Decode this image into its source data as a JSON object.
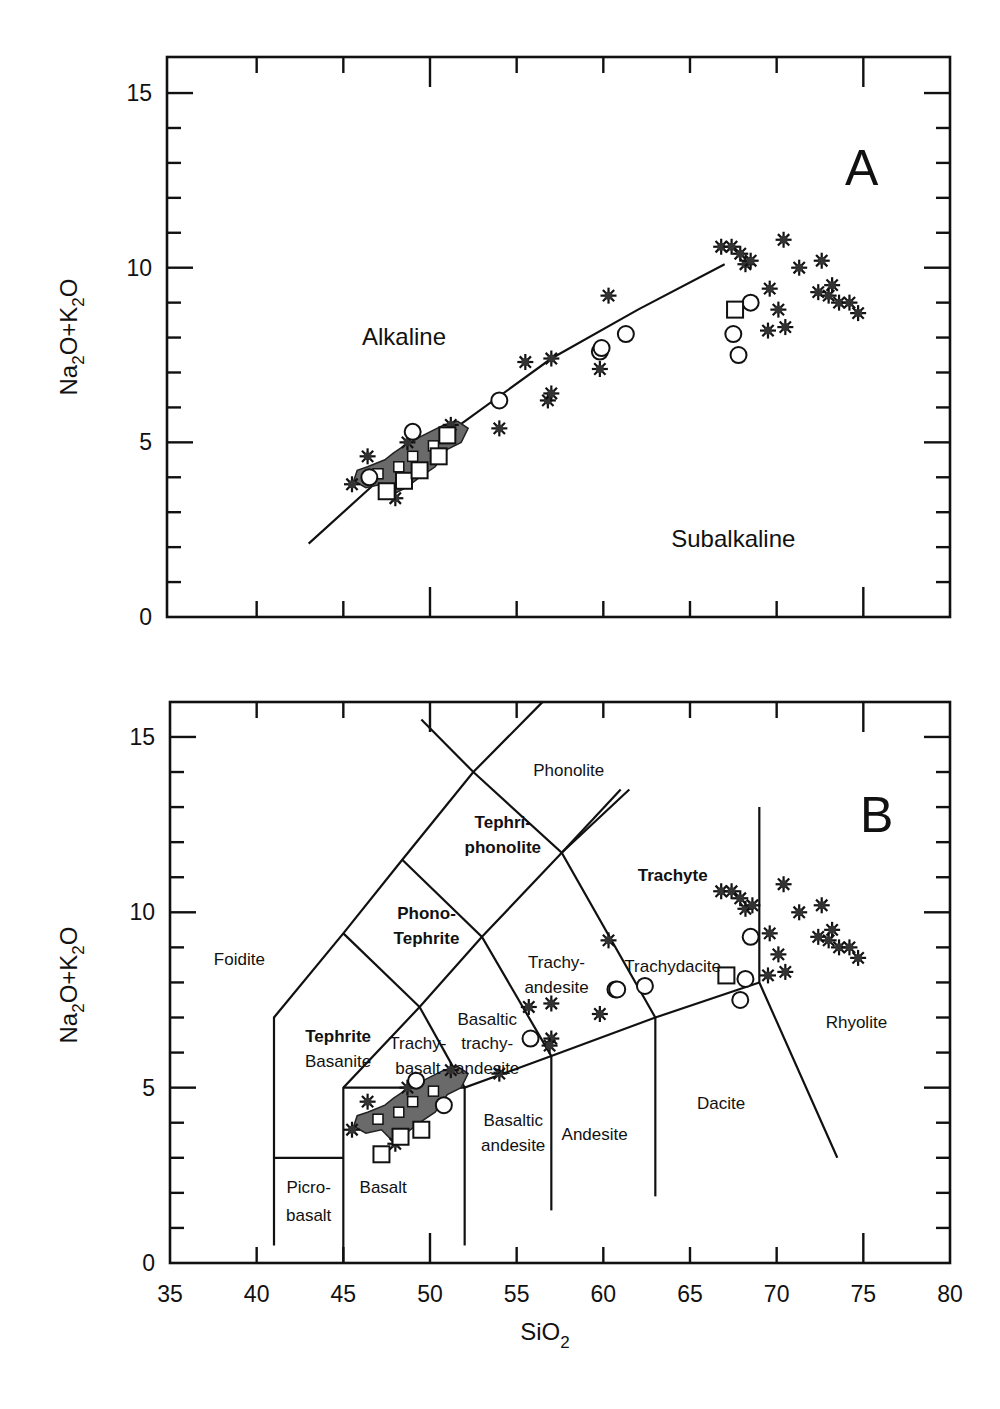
{
  "figure": {
    "x_axis_label": "SiO",
    "x_axis_label_sub": "2",
    "y_axis_label_parts": [
      "Na",
      "2",
      "O+K",
      "2",
      "O"
    ]
  },
  "chart_data": [
    {
      "type": "scatter",
      "panel_label": "A",
      "title": "Alkaline vs Subalkaline (TAS)",
      "xlabel": "SiO2",
      "ylabel": "Na2O+K2O",
      "xlim": [
        35,
        80
      ],
      "ylim": [
        0,
        16
      ],
      "y_ticks": [
        0,
        5,
        10,
        15
      ],
      "x_tick_labels_shown": false,
      "grid": false,
      "region_labels": [
        {
          "text": "Alkaline",
          "x": 48.5,
          "y": 7.8
        },
        {
          "text": "Subalkaline",
          "x": 67.5,
          "y": 2.0
        }
      ],
      "divider_line": {
        "name": "Alkaline-Subalkaline boundary",
        "points": [
          [
            43.0,
            2.1
          ],
          [
            47.0,
            3.9
          ],
          [
            52.0,
            5.6
          ],
          [
            57.0,
            7.4
          ],
          [
            62.0,
            8.8
          ],
          [
            67.0,
            10.1
          ]
        ]
      },
      "series": [
        {
          "name": "asterisks",
          "marker": "asterisk",
          "points": [
            [
              45.5,
              3.8
            ],
            [
              46.4,
              4.6
            ],
            [
              48.0,
              3.4
            ],
            [
              48.7,
              5.0
            ],
            [
              51.2,
              5.5
            ],
            [
              54.0,
              5.4
            ],
            [
              55.5,
              7.3
            ],
            [
              57.0,
              7.4
            ],
            [
              56.8,
              6.2
            ],
            [
              57.0,
              6.4
            ],
            [
              59.8,
              7.1
            ],
            [
              60.3,
              9.2
            ],
            [
              66.8,
              10.6
            ],
            [
              67.4,
              10.6
            ],
            [
              67.9,
              10.4
            ],
            [
              68.2,
              10.1
            ],
            [
              68.5,
              10.2
            ],
            [
              69.6,
              9.4
            ],
            [
              70.1,
              8.8
            ],
            [
              69.5,
              8.2
            ],
            [
              70.5,
              8.3
            ],
            [
              70.4,
              10.8
            ],
            [
              71.3,
              10.0
            ],
            [
              72.6,
              10.2
            ],
            [
              72.4,
              9.3
            ],
            [
              73.0,
              9.2
            ],
            [
              73.6,
              9.0
            ],
            [
              74.2,
              9.0
            ],
            [
              74.7,
              8.7
            ],
            [
              73.2,
              9.5
            ]
          ]
        },
        {
          "name": "circles",
          "marker": "open-circle",
          "points": [
            [
              46.5,
              4.0
            ],
            [
              49.0,
              5.3
            ],
            [
              54.0,
              6.2
            ],
            [
              59.8,
              7.6
            ],
            [
              59.9,
              7.7
            ],
            [
              61.3,
              8.1
            ],
            [
              67.5,
              8.1
            ],
            [
              67.8,
              7.5
            ],
            [
              68.5,
              9.0
            ]
          ]
        },
        {
          "name": "squares",
          "marker": "open-square",
          "points": [
            [
              47.5,
              3.6
            ],
            [
              48.5,
              3.9
            ],
            [
              49.4,
              4.2
            ],
            [
              50.5,
              4.6
            ],
            [
              51.0,
              5.2
            ],
            [
              67.6,
              8.8
            ]
          ]
        },
        {
          "name": "shaded-field",
          "marker": "filled-gray-area",
          "description": "dense cluster of basaltic samples",
          "extent": {
            "x": [
              45.5,
              52.5
            ],
            "y": [
              3.5,
              5.5
            ]
          }
        }
      ]
    },
    {
      "type": "scatter",
      "panel_label": "B",
      "title": "Total Alkali-Silica classification",
      "xlabel": "SiO2",
      "ylabel": "Na2O+K2O",
      "xlim": [
        35,
        80
      ],
      "ylim": [
        0,
        16
      ],
      "x_ticks": [
        35,
        40,
        45,
        50,
        55,
        60,
        65,
        70,
        75,
        80
      ],
      "y_ticks": [
        0,
        5,
        10,
        15
      ],
      "grid": false,
      "field_labels": [
        {
          "text": "Phonolite",
          "x": 58.0,
          "y": 13.9,
          "bold": false
        },
        {
          "text": "Tephri-",
          "x": 54.2,
          "y": 12.4,
          "bold": true
        },
        {
          "text": "phonolite",
          "x": 54.2,
          "y": 11.7,
          "bold": true
        },
        {
          "text": "Phono-",
          "x": 49.8,
          "y": 9.8,
          "bold": true
        },
        {
          "text": "Tephrite",
          "x": 49.8,
          "y": 9.1,
          "bold": true
        },
        {
          "text": "Foidite",
          "x": 39.0,
          "y": 8.5,
          "bold": false
        },
        {
          "text": "Tephrite",
          "x": 44.7,
          "y": 6.3,
          "bold": true
        },
        {
          "text": "Basanite",
          "x": 44.7,
          "y": 5.6,
          "bold": false
        },
        {
          "text": "Trachy-",
          "x": 49.3,
          "y": 6.1,
          "bold": false
        },
        {
          "text": "basalt",
          "x": 49.3,
          "y": 5.4,
          "bold": false
        },
        {
          "text": "Basaltic",
          "x": 53.3,
          "y": 6.8,
          "bold": false
        },
        {
          "text": "trachy-",
          "x": 53.3,
          "y": 6.1,
          "bold": false
        },
        {
          "text": "andesite",
          "x": 53.3,
          "y": 5.4,
          "bold": false
        },
        {
          "text": "Trachy-",
          "x": 57.3,
          "y": 8.4,
          "bold": false
        },
        {
          "text": "andesite",
          "x": 57.3,
          "y": 7.7,
          "bold": false
        },
        {
          "text": "Trachydacite",
          "x": 64.0,
          "y": 8.3,
          "bold": false
        },
        {
          "text": "Trachyte",
          "x": 64.0,
          "y": 10.9,
          "bold": true
        },
        {
          "text": "Rhyolite",
          "x": 74.6,
          "y": 6.7,
          "bold": false
        },
        {
          "text": "Dacite",
          "x": 66.8,
          "y": 4.4,
          "bold": false
        },
        {
          "text": "Andesite",
          "x": 59.5,
          "y": 3.5,
          "bold": false
        },
        {
          "text": "Basaltic",
          "x": 54.8,
          "y": 3.9,
          "bold": false
        },
        {
          "text": "andesite",
          "x": 54.8,
          "y": 3.2,
          "bold": false
        },
        {
          "text": "Basalt",
          "x": 47.3,
          "y": 2.0,
          "bold": false
        },
        {
          "text": "Picro-",
          "x": 43.0,
          "y": 2.0,
          "bold": false
        },
        {
          "text": "basalt",
          "x": 43.0,
          "y": 1.2,
          "bold": false
        }
      ],
      "boundaries": [
        [
          [
            41,
            0.5
          ],
          [
            41,
            7.0
          ],
          [
            45,
            9.4
          ],
          [
            48.4,
            11.5
          ],
          [
            52.5,
            14.0
          ],
          [
            56.5,
            16.0
          ]
        ],
        [
          [
            41,
            3.0
          ],
          [
            45,
            3.0
          ]
        ],
        [
          [
            45,
            0
          ],
          [
            45,
            5.0
          ],
          [
            49.4,
            7.3
          ],
          [
            53.0,
            9.3
          ],
          [
            57.6,
            11.7
          ],
          [
            61.5,
            13.5
          ]
        ],
        [
          [
            45,
            5.0
          ],
          [
            52,
            5.0
          ],
          [
            57,
            5.9
          ],
          [
            63,
            7.0
          ],
          [
            69,
            8.0
          ]
        ],
        [
          [
            52,
            0.5
          ],
          [
            52,
            5.0
          ]
        ],
        [
          [
            57,
            1.5
          ],
          [
            57,
            5.9
          ]
        ],
        [
          [
            63,
            1.9
          ],
          [
            63,
            7.0
          ]
        ],
        [
          [
            49.4,
            7.3
          ],
          [
            52,
            5.0
          ]
        ],
        [
          [
            45,
            9.4
          ],
          [
            49.4,
            7.3
          ]
        ],
        [
          [
            48.4,
            11.5
          ],
          [
            53.0,
            9.3
          ],
          [
            57,
            5.9
          ]
        ],
        [
          [
            52.5,
            14.0
          ],
          [
            57.6,
            11.7
          ],
          [
            63,
            7.0
          ]
        ],
        [
          [
            57.6,
            11.7
          ],
          [
            61,
            13.5
          ]
        ],
        [
          [
            49.5,
            15.5
          ],
          [
            52.5,
            14.0
          ]
        ],
        [
          [
            69,
            13.0
          ],
          [
            69,
            8.0
          ],
          [
            73.5,
            3.0
          ]
        ]
      ],
      "series": [
        {
          "name": "asterisks",
          "marker": "asterisk",
          "points": [
            [
              45.5,
              3.8
            ],
            [
              46.4,
              4.6
            ],
            [
              48.0,
              3.4
            ],
            [
              48.7,
              5.0
            ],
            [
              51.2,
              5.5
            ],
            [
              54.0,
              5.4
            ],
            [
              55.7,
              7.3
            ],
            [
              57.0,
              7.4
            ],
            [
              57.0,
              6.4
            ],
            [
              56.9,
              6.2
            ],
            [
              59.8,
              7.1
            ],
            [
              60.3,
              9.2
            ],
            [
              66.8,
              10.6
            ],
            [
              67.4,
              10.6
            ],
            [
              67.9,
              10.4
            ],
            [
              68.2,
              10.1
            ],
            [
              68.6,
              10.2
            ],
            [
              69.6,
              9.4
            ],
            [
              70.1,
              8.8
            ],
            [
              69.5,
              8.2
            ],
            [
              70.5,
              8.3
            ],
            [
              70.4,
              10.8
            ],
            [
              71.3,
              10.0
            ],
            [
              72.6,
              10.2
            ],
            [
              72.4,
              9.3
            ],
            [
              73.0,
              9.2
            ],
            [
              73.6,
              9.0
            ],
            [
              74.2,
              9.0
            ],
            [
              74.7,
              8.7
            ],
            [
              73.2,
              9.5
            ]
          ]
        },
        {
          "name": "circles",
          "marker": "open-circle",
          "points": [
            [
              49.2,
              5.2
            ],
            [
              50.8,
              4.5
            ],
            [
              55.8,
              6.4
            ],
            [
              60.7,
              7.8
            ],
            [
              60.8,
              7.8
            ],
            [
              62.4,
              7.9
            ],
            [
              68.5,
              9.3
            ],
            [
              68.2,
              8.1
            ],
            [
              67.9,
              7.5
            ]
          ]
        },
        {
          "name": "squares",
          "marker": "open-square",
          "points": [
            [
              47.2,
              3.1
            ],
            [
              48.3,
              3.6
            ],
            [
              49.5,
              3.8
            ],
            [
              67.1,
              8.2
            ]
          ]
        },
        {
          "name": "shaded-field",
          "marker": "filled-gray-area",
          "description": "dense cluster of basaltic samples",
          "extent": {
            "x": [
              45.5,
              52.5
            ],
            "y": [
              3.5,
              5.5
            ]
          }
        }
      ]
    }
  ]
}
